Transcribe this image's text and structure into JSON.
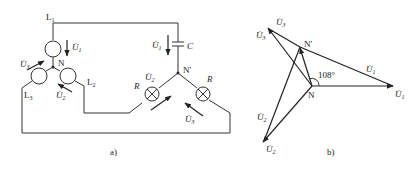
{
  "figure_a": {
    "caption": "a)",
    "lines": {
      "L1": "L",
      "L1_sub": "1",
      "L2": "L",
      "L2_sub": "2",
      "L3": "L",
      "L3_sub": "3"
    },
    "neutral_source": "N",
    "neutral_load": "N'",
    "capacitor": "C",
    "resistor_left": "R",
    "resistor_right": "R",
    "voltages": {
      "U1": "U",
      "U1_sub": "1",
      "U2": "U",
      "U2_sub": "2",
      "U3": "U",
      "U3_sub": "3",
      "U1p": "U",
      "U1p_sub": "1",
      "U2p": "U",
      "U2p_sub": "2",
      "U3p": "U",
      "U3p_sub": "3"
    }
  },
  "figure_b": {
    "caption": "b)",
    "angle": "108°",
    "neutral_source": "N",
    "neutral_load": "N'",
    "phasors": {
      "U1": "U",
      "U1_sub": "1",
      "U2": "U",
      "U2_sub": "2",
      "U3": "U",
      "U3_sub": "3",
      "U1p": "U",
      "U1p_sub": "1",
      "U2p": "U",
      "U2p_sub": "2",
      "U3p": "U",
      "U3p_sub": "3"
    }
  },
  "colors": {
    "stroke": "#333333",
    "background": "#ffffff"
  }
}
